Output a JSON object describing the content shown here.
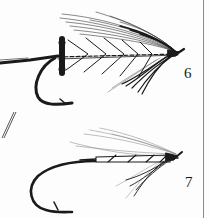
{
  "illustration": {
    "subject": "fishing flies",
    "figures": [
      {
        "number": "6",
        "description": "fly with dark wing, chevron-ribbed body, black butt hackle"
      },
      {
        "number": "7",
        "description": "sparse fly with light wing, ribbed body, dark throat hackle"
      }
    ]
  },
  "colors": {
    "ink": "#1a1a1a",
    "paper": "#fdfdfd",
    "rule": "#8a8a8a"
  }
}
